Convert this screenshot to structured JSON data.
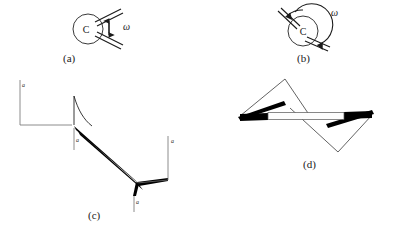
{
  "figure": {
    "background_color": "#ffffff",
    "ink_color": "#000000",
    "width": 402,
    "height": 239
  },
  "panels": [
    {
      "id": "a",
      "label": "(a)",
      "label_x": 63,
      "label_y": 62,
      "type": "hinge-circle-straight",
      "center_label": "C",
      "center_label_x": 86,
      "center_label_y": 33,
      "omega_label": "ω",
      "omega_label_x": 123,
      "omega_label_y": 30,
      "circle": {
        "cx": 88,
        "cy": 29,
        "r": 15
      },
      "arrow_kind": "double-headed-vertical",
      "description": "Circle hinge C with two parallel arms leaving upper right, vertical double arrow labelled omega"
    },
    {
      "id": "b",
      "label": "(b)",
      "label_x": 297,
      "label_y": 62,
      "type": "hinge-circle-rotated",
      "center_label": "C",
      "center_label_x": 303,
      "center_label_y": 35,
      "omega_label": "ω",
      "omega_label_x": 331,
      "omega_label_y": 16,
      "circle": {
        "cx": 303,
        "cy": 31,
        "r": 15
      },
      "arrow_kind": "curved-arc-double",
      "description": "Circle hinge C with two arms and a large circular double-headed arc arrow labelled omega"
    },
    {
      "id": "c",
      "label": "(c)",
      "label_x": 88,
      "label_y": 219,
      "type": "zigzag-strut",
      "description": "Zigzag strut assembly, thick sloping double band between two stepped thin end members",
      "dimension_labels": [
        {
          "text": "a",
          "x": 22,
          "y": 87
        },
        {
          "text": "a",
          "x": 76,
          "y": 142
        },
        {
          "text": "a",
          "x": 171,
          "y": 143
        },
        {
          "text": "a",
          "x": 134,
          "y": 204
        }
      ]
    },
    {
      "id": "d",
      "label": "(d)",
      "label_x": 303,
      "label_y": 168,
      "type": "double-triangle-bar",
      "description": "Two thin triangles pointing up-left and down-right joined by a horizontal hollow bar with solid black tapered ends"
    }
  ],
  "symbols": {
    "omega": "ω",
    "hinge": "C",
    "dimension": "a"
  }
}
